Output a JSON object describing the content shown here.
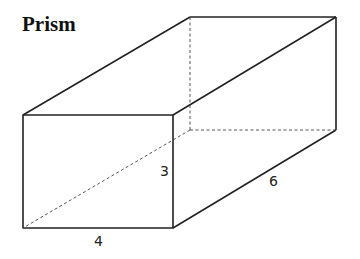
{
  "title": "Prism",
  "labels": {
    "length": "4",
    "height": "3",
    "depth": "6"
  },
  "colors": {
    "stroke": "#222222"
  }
}
